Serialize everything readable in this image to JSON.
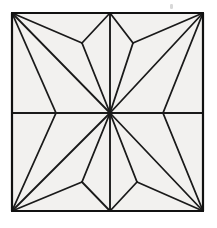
{
  "figure": {
    "type": "planar-triangulation",
    "colors": {
      "background": "#ffffff",
      "face_fill": "#f2f1ef",
      "edge": "#1a1a1a",
      "outline": "#111111",
      "speck": "#d9d9d9"
    },
    "strokes": {
      "outline_width": 2.2,
      "midline_width": 1.9,
      "interior_width": 1.8
    },
    "canvas": {
      "width": 217,
      "height": 228
    },
    "square": {
      "left": 12,
      "top": 13,
      "right": 203,
      "bottom": 211,
      "width": 191,
      "height": 198
    },
    "vertices": {
      "corner_top_left": [
        12,
        13
      ],
      "corner_top_right": [
        203,
        13
      ],
      "corner_bottom_left": [
        12,
        211
      ],
      "corner_bottom_right": [
        203,
        211
      ],
      "center": [
        110,
        113
      ],
      "edge_top_mid": [
        110,
        13
      ],
      "edge_bottom_mid": [
        110,
        211
      ],
      "edge_left_mid": [
        12,
        113
      ],
      "edge_right_mid": [
        203,
        113
      ],
      "junction_top_left": [
        82,
        43
      ],
      "junction_top_right": [
        133,
        43
      ],
      "junction_bottom_left": [
        82,
        182
      ],
      "junction_bottom_right": [
        137,
        182
      ],
      "side_left_upper": [
        56,
        113
      ],
      "side_right_upper": [
        163,
        113
      ],
      "side_left_lower": [
        56,
        113
      ],
      "side_right_lower": [
        163,
        113
      ]
    },
    "vertex_count": 13,
    "edge_count": 28,
    "face_count": 16,
    "segments": [
      {
        "name": "outline-top",
        "from": "corner_top_left",
        "to": "corner_top_right",
        "kind": "outline"
      },
      {
        "name": "outline-right",
        "from": "corner_top_right",
        "to": "corner_bottom_right",
        "kind": "outline"
      },
      {
        "name": "outline-bottom",
        "from": "corner_bottom_right",
        "to": "corner_bottom_left",
        "kind": "outline"
      },
      {
        "name": "outline-left",
        "from": "corner_bottom_left",
        "to": "corner_top_left",
        "kind": "outline"
      },
      {
        "name": "midline-vertical",
        "from": "edge_top_mid",
        "to": "edge_bottom_mid",
        "kind": "midline"
      },
      {
        "name": "midline-horizontal",
        "from": "edge_left_mid",
        "to": "edge_right_mid",
        "kind": "midline"
      },
      {
        "name": "tl-corner-to-junction",
        "from": "corner_top_left",
        "to": "junction_top_left",
        "kind": "interior"
      },
      {
        "name": "tl-corner-to-sideleft",
        "from": "corner_top_left",
        "to": "side_left_upper",
        "kind": "interior"
      },
      {
        "name": "tl-corner-to-center",
        "from": "corner_top_left",
        "to": "center",
        "kind": "interior"
      },
      {
        "name": "tl-junction-to-topmid",
        "from": "junction_top_left",
        "to": "edge_top_mid",
        "kind": "interior"
      },
      {
        "name": "tl-junction-to-center",
        "from": "junction_top_left",
        "to": "center",
        "kind": "interior"
      },
      {
        "name": "tl-sideleft-to-center",
        "from": "side_left_upper",
        "to": "center",
        "kind": "interior"
      },
      {
        "name": "tr-corner-to-junction",
        "from": "corner_top_right",
        "to": "junction_top_right",
        "kind": "interior"
      },
      {
        "name": "tr-corner-to-sideright",
        "from": "corner_top_right",
        "to": "side_right_upper",
        "kind": "interior"
      },
      {
        "name": "tr-corner-to-center",
        "from": "corner_top_right",
        "to": "center",
        "kind": "interior"
      },
      {
        "name": "tr-junction-to-topmid",
        "from": "junction_top_right",
        "to": "edge_top_mid",
        "kind": "interior"
      },
      {
        "name": "tr-junction-to-center",
        "from": "junction_top_right",
        "to": "center",
        "kind": "interior"
      },
      {
        "name": "tr-sideright-to-center",
        "from": "side_right_upper",
        "to": "center",
        "kind": "interior"
      },
      {
        "name": "bl-corner-to-junction",
        "from": "corner_bottom_left",
        "to": "junction_bottom_left",
        "kind": "interior"
      },
      {
        "name": "bl-corner-to-sideleft",
        "from": "corner_bottom_left",
        "to": "side_left_lower",
        "kind": "interior"
      },
      {
        "name": "bl-corner-to-center",
        "from": "corner_bottom_left",
        "to": "center",
        "kind": "interior"
      },
      {
        "name": "bl-junction-to-botmid",
        "from": "junction_bottom_left",
        "to": "edge_bottom_mid",
        "kind": "interior"
      },
      {
        "name": "bl-junction-to-center",
        "from": "junction_bottom_left",
        "to": "center",
        "kind": "interior"
      },
      {
        "name": "br-corner-to-junction",
        "from": "corner_bottom_right",
        "to": "junction_bottom_right",
        "kind": "interior"
      },
      {
        "name": "br-corner-to-sideright",
        "from": "corner_bottom_right",
        "to": "side_right_lower",
        "kind": "interior"
      },
      {
        "name": "br-corner-to-center",
        "from": "corner_bottom_right",
        "to": "center",
        "kind": "interior"
      },
      {
        "name": "br-junction-to-botmid",
        "from": "junction_bottom_right",
        "to": "edge_bottom_mid",
        "kind": "interior"
      },
      {
        "name": "br-junction-to-center",
        "from": "junction_bottom_right",
        "to": "center",
        "kind": "interior"
      }
    ],
    "paths": {
      "outline": "M12,13 L203,13 L203,211 L12,211 Z",
      "midline_vertical": "M110,13 L110,211",
      "midline_horizontal": "M12,113 L203,113",
      "tl_corner_to_junction": "M12,13 L82,43",
      "tl_corner_to_sideleft": "M12,13 L56,113",
      "tl_corner_to_center": "M12,13 L110,113",
      "tl_junction_to_topmid": "M82,43 L110,13",
      "tl_junction_to_center": "M82,43 L110,113",
      "tl_sideleft_to_center": "M56,113 L110,113",
      "tr_corner_to_junction": "M203,13 L133,43",
      "tr_corner_to_sideright": "M203,13 L163,113",
      "tr_corner_to_center": "M203,13 L110,113",
      "tr_junction_to_topmid": "M133,43 L110,13",
      "tr_junction_to_center": "M133,43 L110,113",
      "tr_sideright_to_center": "M163,113 L110,113",
      "bl_corner_to_junction": "M12,211 L82,182",
      "bl_corner_to_sideleft": "M12,211 L56,113",
      "bl_corner_to_center": "M12,211 L110,113",
      "bl_junction_to_botmid": "M82,182 L110,211",
      "bl_junction_to_center": "M82,182 L110,113",
      "br_corner_to_junction": "M203,211 L137,182",
      "br_corner_to_sideright": "M203,211 L163,113",
      "br_corner_to_center": "M203,211 L110,113",
      "br_junction_to_botmid": "M137,182 L110,211",
      "br_junction_to_center": "M137,182 L110,113"
    },
    "faces": [
      {
        "name": "face-tl-1",
        "points": "12,13 82,43 110,113 56,113"
      },
      {
        "name": "face-tl-upper",
        "points": "12,13 110,13 82,43"
      },
      {
        "name": "face-tl-right",
        "points": "82,43 110,13 110,113"
      },
      {
        "name": "face-tl-lower",
        "points": "12,13 56,113 12,113"
      },
      {
        "name": "face-tr-1",
        "points": "203,13 133,43 110,113 163,113"
      },
      {
        "name": "face-tr-upper",
        "points": "203,13 110,13 133,43"
      },
      {
        "name": "face-tr-left",
        "points": "133,43 110,13 110,113"
      },
      {
        "name": "face-tr-lower",
        "points": "203,13 163,113 203,113"
      },
      {
        "name": "face-bl-1",
        "points": "12,211 82,182 110,113 56,113"
      },
      {
        "name": "face-bl-lower",
        "points": "12,211 110,211 82,182"
      },
      {
        "name": "face-bl-right",
        "points": "82,182 110,211 110,113"
      },
      {
        "name": "face-bl-upper",
        "points": "12,211 56,113 12,113"
      },
      {
        "name": "face-br-1",
        "points": "203,211 137,182 110,113 163,113"
      },
      {
        "name": "face-br-lower",
        "points": "203,211 110,211 137,182"
      },
      {
        "name": "face-br-left",
        "points": "137,182 110,211 110,113"
      },
      {
        "name": "face-br-upper",
        "points": "203,211 163,113 203,113"
      }
    ],
    "artifact": {
      "name": "scan-speck",
      "x": 170,
      "y": 4,
      "width": 3,
      "height": 5
    }
  }
}
